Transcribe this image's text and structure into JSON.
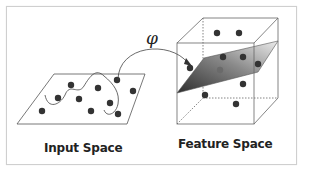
{
  "labels": {
    "input_space": "Input Space",
    "feature_space": "Feature Space",
    "mapping_symbol": "φ"
  },
  "colors": {
    "point": "#333333",
    "line": "#555555",
    "frame": "#cfcfcf",
    "plane_dark": "#3a3a3a",
    "plane_light": "#e6e6e6"
  },
  "input_space": {
    "points": [
      [
        42,
        111
      ],
      [
        58,
        98
      ],
      [
        71,
        85
      ],
      [
        79,
        99
      ],
      [
        98,
        88
      ],
      [
        91,
        111
      ],
      [
        110,
        103
      ],
      [
        118,
        114
      ],
      [
        117,
        80
      ],
      [
        133,
        91
      ]
    ]
  },
  "feature_space": {
    "points_above_plane": [
      [
        217,
        33
      ],
      [
        239,
        33
      ],
      [
        223,
        57
      ],
      [
        243,
        57
      ]
    ],
    "points_on_plane": [
      [
        258,
        64
      ],
      [
        220,
        70
      ]
    ],
    "points_below_plane": [
      [
        243,
        84
      ],
      [
        205,
        95
      ],
      [
        236,
        104
      ]
    ],
    "mapped_point": [
      190,
      68
    ]
  }
}
